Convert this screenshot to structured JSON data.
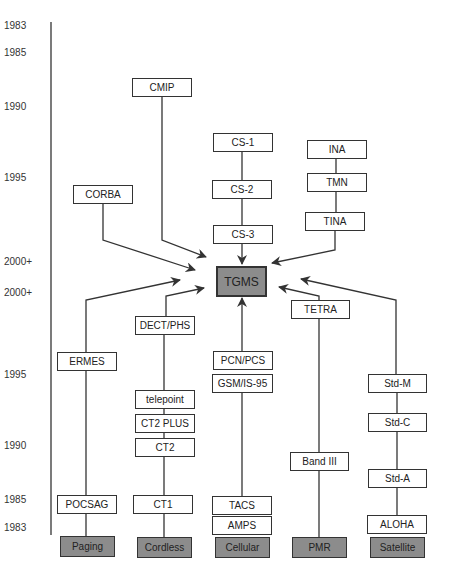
{
  "timeline": {
    "top_years": [
      {
        "label": "1983",
        "y": 20
      },
      {
        "label": "1985",
        "y": 47
      },
      {
        "label": "1990",
        "y": 101
      },
      {
        "label": "1995",
        "y": 172
      },
      {
        "label": "2000+",
        "y": 256
      }
    ],
    "bottom_years": [
      {
        "label": "2000+",
        "y": 287
      },
      {
        "label": "1995",
        "y": 369
      },
      {
        "label": "1990",
        "y": 440
      },
      {
        "label": "1985",
        "y": 494
      },
      {
        "label": "1983",
        "y": 522
      }
    ]
  },
  "center": {
    "label": "TGMS",
    "fill": "#8c8c8c"
  },
  "management_nodes": {
    "cmip": "CMIP",
    "corba": "CORBA",
    "cs1": "CS-1",
    "cs2": "CS-2",
    "cs3": "CS-3",
    "ina": "INA",
    "tmn": "TMN",
    "tina": "TINA"
  },
  "system_nodes": {
    "ermes": "ERMES",
    "pocsag": "POCSAG",
    "dect_phs": "DECT/PHS",
    "telepoint": "telepoint",
    "ct2plus": "CT2 PLUS",
    "ct2": "CT2",
    "ct1": "CT1",
    "pcn_pcs": "PCN/PCS",
    "gsm_is95": "GSM/IS-95",
    "tacs": "TACS",
    "amps": "AMPS",
    "tetra": "TETRA",
    "band3": "Band III",
    "std_m": "Std-M",
    "std_c": "Std-C",
    "std_a": "Std-A",
    "aloha": "ALOHA"
  },
  "categories": {
    "paging": "Paging",
    "cordless": "Cordless",
    "cellular": "Cellular",
    "pmr": "PMR",
    "satellite": "Satellite"
  },
  "colors": {
    "category_fill": "#8c8c8c",
    "line": "#333333"
  }
}
